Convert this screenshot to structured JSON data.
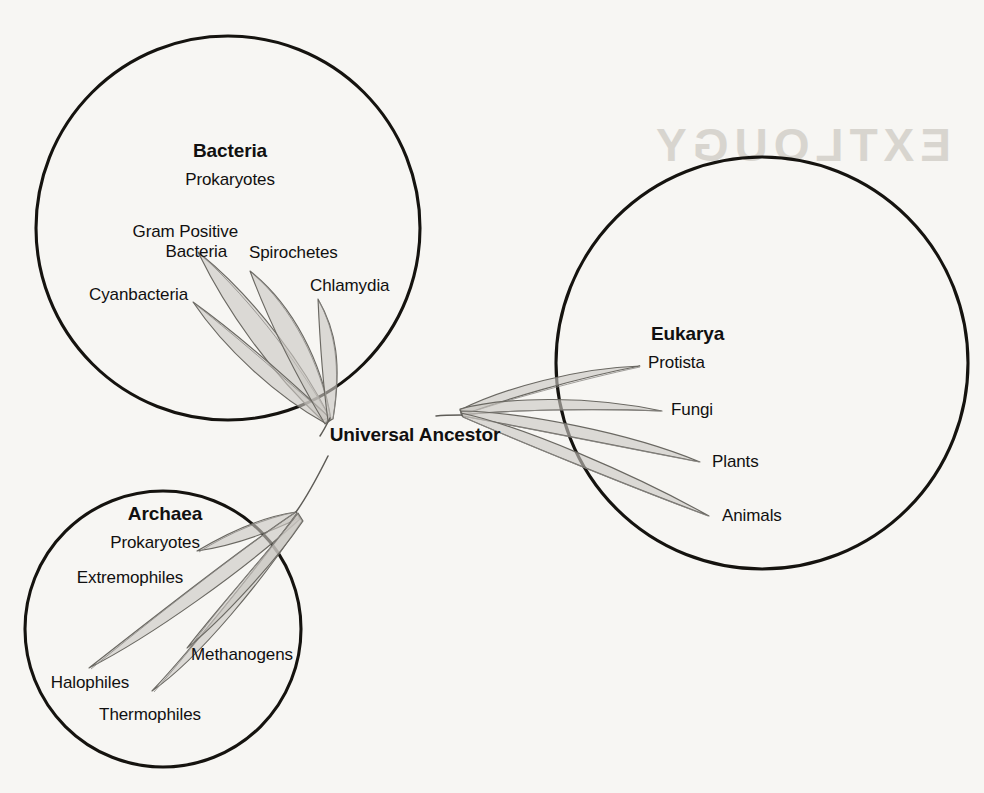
{
  "diagram": {
    "type": "rooted-phylogenetic-tree",
    "root_label": "Universal Ancestor",
    "background_bleed_text": "EXTLOUGY",
    "colors": {
      "page_background": "#f7f6f3",
      "circle_stroke": "#15130f",
      "leaf_fill": "#c9c7c2",
      "leaf_stroke": "#6a6862",
      "text": "#111010"
    },
    "domains": [
      {
        "id": "bacteria",
        "name": "Bacteria",
        "subtitle": "Prokaryotes",
        "circle": {
          "cx": 228,
          "cy": 228,
          "r": 192
        },
        "branch_origin": {
          "x": 330,
          "y": 418
        },
        "branches": [
          {
            "label": "Gram Positive\nBacteria",
            "tip": {
              "x": 196,
              "y": 253
            }
          },
          {
            "label": "Spirochetes",
            "tip": {
              "x": 248,
              "y": 272
            }
          },
          {
            "label": "Chlamydia",
            "tip": {
              "x": 316,
              "y": 300
            }
          },
          {
            "label": "Cyanbacteria",
            "tip": {
              "x": 191,
              "y": 303
            }
          }
        ]
      },
      {
        "id": "archaea",
        "name": "Archaea",
        "subtitle": "Prokaryotes",
        "circle": {
          "cx": 163,
          "cy": 629,
          "r": 138
        },
        "branch_origin": {
          "x": 296,
          "y": 512
        },
        "branches": [
          {
            "label": "Extremophiles",
            "tip": {
              "x": 196,
              "y": 553
            }
          },
          {
            "label": "Halophiles",
            "tip": {
              "x": 87,
              "y": 669
            }
          },
          {
            "label": "Thermophiles",
            "tip": {
              "x": 151,
              "y": 692
            }
          },
          {
            "label": "Methanogens",
            "tip": {
              "x": 186,
              "y": 649
            }
          }
        ]
      },
      {
        "id": "eukarya",
        "name": "Eukarya",
        "subtitle": "",
        "circle": {
          "cx": 762,
          "cy": 363,
          "r": 206
        },
        "branch_origin": {
          "x": 462,
          "y": 415
        },
        "branches": [
          {
            "label": "Protista",
            "tip": {
              "x": 640,
              "y": 366
            }
          },
          {
            "label": "Fungi",
            "tip": {
              "x": 661,
              "y": 411
            }
          },
          {
            "label": "Plants",
            "tip": {
              "x": 700,
              "y": 462
            }
          },
          {
            "label": "Animals",
            "tip": {
              "x": 708,
              "y": 516
            }
          }
        ]
      }
    ],
    "labels": {
      "bacteria_title": "Bacteria",
      "bacteria_subtitle": "Prokaryotes",
      "gram_positive_line1": "Gram Positive",
      "gram_positive_line2": "Bacteria",
      "spirochetes": "Spirochetes",
      "chlamydia": "Chlamydia",
      "cyanbacteria": "Cyanbacteria",
      "archaea_title": "Archaea",
      "archaea_subtitle": "Prokaryotes",
      "extremophiles": "Extremophiles",
      "halophiles": "Halophiles",
      "thermophiles": "Thermophiles",
      "methanogens": "Methanogens",
      "eukarya_title": "Eukarya",
      "protista": "Protista",
      "fungi": "Fungi",
      "plants": "Plants",
      "animals": "Animals",
      "universal_ancestor": "Universal Ancestor"
    }
  }
}
